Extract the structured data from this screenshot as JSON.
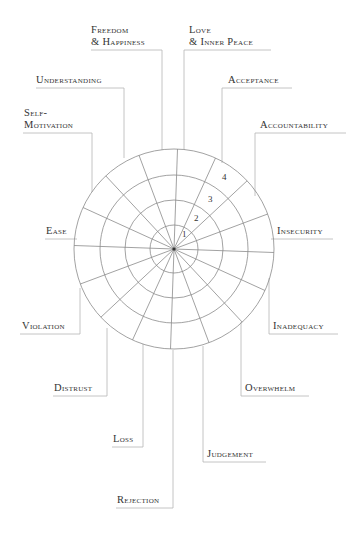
{
  "diagram": {
    "type": "radial-wheel",
    "rings": [
      1,
      2,
      3,
      4
    ],
    "segments": 16,
    "labels": [
      {
        "id": "freedom-happiness",
        "lines": [
          "Freedom",
          "& Happiness"
        ]
      },
      {
        "id": "love-inner-peace",
        "lines": [
          "Love",
          "& Inner Peace"
        ]
      },
      {
        "id": "understanding",
        "lines": [
          "Understanding"
        ]
      },
      {
        "id": "acceptance",
        "lines": [
          "Acceptance"
        ]
      },
      {
        "id": "self-motivation",
        "lines": [
          "Self-",
          "Motivation"
        ]
      },
      {
        "id": "accountability",
        "lines": [
          "Accountability"
        ]
      },
      {
        "id": "ease",
        "lines": [
          "Ease"
        ]
      },
      {
        "id": "insecurity",
        "lines": [
          "Insecurity"
        ]
      },
      {
        "id": "violation",
        "lines": [
          "Violation"
        ]
      },
      {
        "id": "inadequacy",
        "lines": [
          "Inadequacy"
        ]
      },
      {
        "id": "distrust",
        "lines": [
          "Distrust"
        ]
      },
      {
        "id": "overwhelm",
        "lines": [
          "Overwhelm"
        ]
      },
      {
        "id": "loss",
        "lines": [
          "Loss"
        ]
      },
      {
        "id": "judgement",
        "lines": [
          "Judgement"
        ]
      },
      {
        "id": "rejection",
        "lines": [
          "Rejection"
        ]
      }
    ],
    "ring_labels": [
      "1",
      "2",
      "3",
      "4"
    ],
    "colors": {
      "line": "#8a8a8a",
      "connector": "#b0b0b0",
      "text": "#333333",
      "background": "#ffffff"
    }
  }
}
